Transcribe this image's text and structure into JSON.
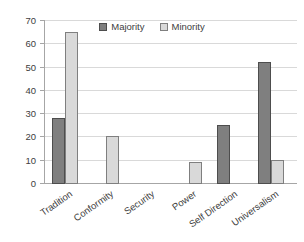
{
  "chart_data": {
    "type": "bar",
    "title": "",
    "categories": [
      "Tradition",
      "Conformity",
      "Security",
      "Power",
      "Self Direction",
      "Universalism"
    ],
    "series": [
      {
        "name": "Majority",
        "values": [
          28,
          0,
          0,
          0,
          25,
          52
        ],
        "fill": "#7f7f7f",
        "border": "#4d4d4d"
      },
      {
        "name": "Minority",
        "values": [
          65,
          20,
          0,
          9,
          0,
          10
        ],
        "fill": "#d9d9d9",
        "border": "#7f7f7f"
      }
    ],
    "ylim": [
      0,
      70
    ],
    "ytick_step": 10,
    "ytick_labels": [
      "0",
      "10",
      "20",
      "30",
      "40",
      "50",
      "60",
      "70"
    ],
    "xlabel": "",
    "ylabel": "",
    "grid": true,
    "legend_position": "top-inside",
    "colors": {
      "gridline": "#d9d9d9",
      "axis": "#a6a6a6",
      "text": "#404040",
      "background": "#ffffff"
    }
  }
}
